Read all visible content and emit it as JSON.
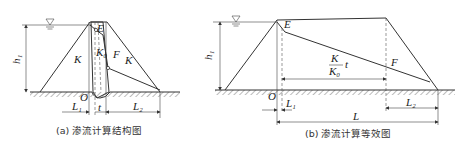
{
  "figure_a": {
    "caption": "(a) 渗流计算结构图",
    "labels": {
      "h1": "h₁",
      "K_left": "K",
      "K_right": "K",
      "K0": "K₀",
      "E": "E",
      "F": "F",
      "O": "O",
      "L1": "L₁",
      "t": "t",
      "L2": "L₂"
    },
    "water_level_symbol": "▽"
  },
  "figure_b": {
    "caption": "(b) 渗流计算等效图",
    "labels": {
      "h1": "h₁",
      "E": "E",
      "F": "F",
      "O": "O",
      "L1": "L₁",
      "L2": "L₂",
      "L": "L",
      "frac_num": "K",
      "frac_den": "K₀",
      "frac_t": "t"
    },
    "water_level_symbol": "▽"
  },
  "colors": {
    "line": "#333333",
    "background": "#ffffff"
  }
}
